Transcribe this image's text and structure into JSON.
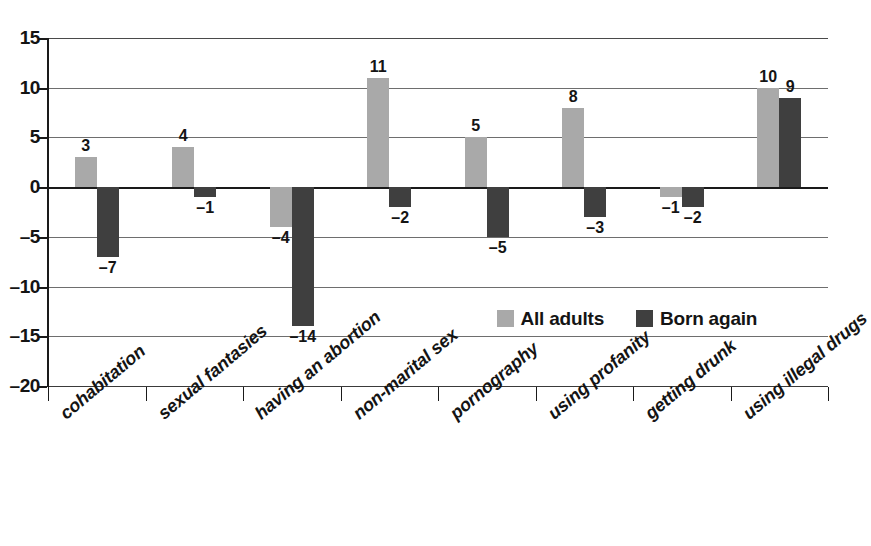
{
  "chart_data": {
    "type": "bar",
    "title": "",
    "subtitle": "",
    "xlabel": "",
    "ylabel": "",
    "ylim": [
      -20,
      15
    ],
    "yticks": [
      "15",
      "10",
      "5",
      "0",
      "-5",
      "-10",
      "-15",
      "-20"
    ],
    "ytick_values": [
      15,
      10,
      5,
      0,
      -5,
      -10,
      -15,
      -20
    ],
    "grid": true,
    "legend_position": "inside-lower-right",
    "categories": [
      "cohabitation",
      "sexual fantasies",
      "having an abortion",
      "non-marital sex",
      "pornography",
      "using profanity",
      "getting drunk",
      "using illegal drugs"
    ],
    "series": [
      {
        "name": "All adults",
        "color": "#a9a9a9",
        "values": [
          3,
          4,
          -4,
          11,
          5,
          8,
          -1,
          10
        ],
        "labels": [
          "3",
          "4",
          "–4",
          "11",
          "5",
          "8",
          "–1",
          "10"
        ]
      },
      {
        "name": "Born again",
        "color": "#3f3f3f",
        "values": [
          -7,
          -1,
          -14,
          -2,
          -5,
          -3,
          -2,
          9
        ],
        "labels": [
          "–7",
          "–1",
          "–14",
          "–2",
          "–5",
          "–3",
          "–2",
          "9"
        ]
      }
    ]
  },
  "legend": {
    "items": [
      {
        "label": "All adults",
        "color": "#a9a9a9"
      },
      {
        "label": "Born again",
        "color": "#3f3f3f"
      }
    ]
  },
  "axis": {
    "y_ticks": [
      {
        "label": "15"
      },
      {
        "label": "10"
      },
      {
        "label": "5"
      },
      {
        "label": "0"
      },
      {
        "label": "–5"
      },
      {
        "label": "–10"
      },
      {
        "label": "–15"
      },
      {
        "label": "–20"
      }
    ]
  }
}
